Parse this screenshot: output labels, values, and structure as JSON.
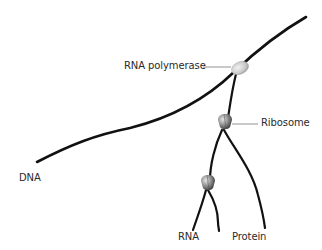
{
  "diagram": {
    "labels": {
      "rna_polymerase": "RNA polymerase",
      "ribosome": "Ribosome",
      "dna": "DNA",
      "rna": "RNA",
      "protein": "Protein"
    },
    "nodes": [
      {
        "id": "rna_polymerase",
        "shape": "ellipse",
        "color": "#cfcfcf"
      },
      {
        "id": "ribosome_1",
        "shape": "ribosome",
        "color": "#9a9a9a"
      },
      {
        "id": "ribosome_2",
        "shape": "ribosome",
        "color": "#9a9a9a"
      }
    ],
    "edges": [
      {
        "from": "dna_start",
        "to": "rna_polymerase",
        "type": "DNA strand"
      },
      {
        "from": "rna_polymerase",
        "to": "dna_end",
        "type": "DNA strand"
      },
      {
        "from": "rna_polymerase",
        "to": "ribosome_1",
        "type": "RNA"
      },
      {
        "from": "ribosome_1",
        "to": "ribosome_2",
        "type": "RNA"
      },
      {
        "from": "ribosome_1",
        "to": "protein_end",
        "type": "Protein"
      },
      {
        "from": "ribosome_2",
        "to": "rna_end",
        "type": "RNA"
      },
      {
        "from": "ribosome_2",
        "to": "protein_end_2",
        "type": "Protein"
      }
    ],
    "colors": {
      "strand": "#111111",
      "leader": "#777777",
      "background": "#ffffff"
    }
  }
}
